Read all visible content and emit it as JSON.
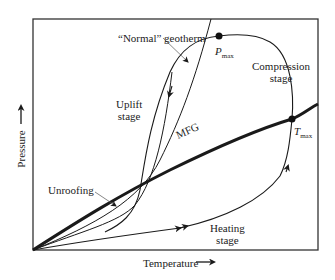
{
  "diagram": {
    "type": "P-T path diagram",
    "axes": {
      "x_label": "Temperature",
      "y_label": "Pressure",
      "x_arrow": "→",
      "y_arrow": "→"
    },
    "curves": {
      "geotherm_label": "“Normal” geotherm",
      "mfg_label": "MFG"
    },
    "points": {
      "pmax": {
        "main": "P",
        "sub": "max"
      },
      "tmax": {
        "main": "T",
        "sub": "max"
      }
    },
    "stages": {
      "compression": [
        "Compression",
        "stage"
      ],
      "uplift": [
        "Uplift",
        "stage"
      ],
      "heating": [
        "Heating",
        "stage"
      ],
      "unroofing": "Unroofing"
    },
    "colors": {
      "line": "#1a1a1a",
      "frame": "#333333",
      "background": "#ffffff"
    }
  }
}
